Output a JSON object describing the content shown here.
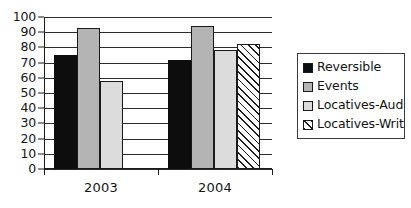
{
  "chart_data": {
    "type": "bar",
    "title": "",
    "xlabel": "",
    "ylabel": "",
    "categories": [
      "2003",
      "2004"
    ],
    "ylim": [
      0,
      100
    ],
    "yticks": [
      0,
      10,
      20,
      30,
      40,
      50,
      60,
      70,
      80,
      90,
      100
    ],
    "grid": true,
    "legend_position": "right",
    "series": [
      {
        "name": "Reversible",
        "swatch": "solid-black",
        "color": "#0d0d0d",
        "values": [
          75,
          72
        ]
      },
      {
        "name": "Events",
        "swatch": "solid-gray",
        "color": "#b4b4b4",
        "values": [
          93,
          94
        ]
      },
      {
        "name": "Locatives-Aud",
        "swatch": "solid-light",
        "color": "#dcdcdc",
        "values": [
          58,
          78
        ]
      },
      {
        "name": "Locatives-Writ",
        "swatch": "diagonal-hatch",
        "color": "#ffffff",
        "values": [
          null,
          82
        ]
      }
    ]
  },
  "axis": {
    "tick_labels": [
      "100",
      "90",
      "80",
      "70",
      "60",
      "50",
      "40",
      "30",
      "20",
      "10",
      "0"
    ]
  },
  "legend": {
    "entries": [
      {
        "label": "Reversible"
      },
      {
        "label": "Events"
      },
      {
        "label": "Locatives-Aud"
      },
      {
        "label": "Locatives-Writ"
      }
    ]
  }
}
